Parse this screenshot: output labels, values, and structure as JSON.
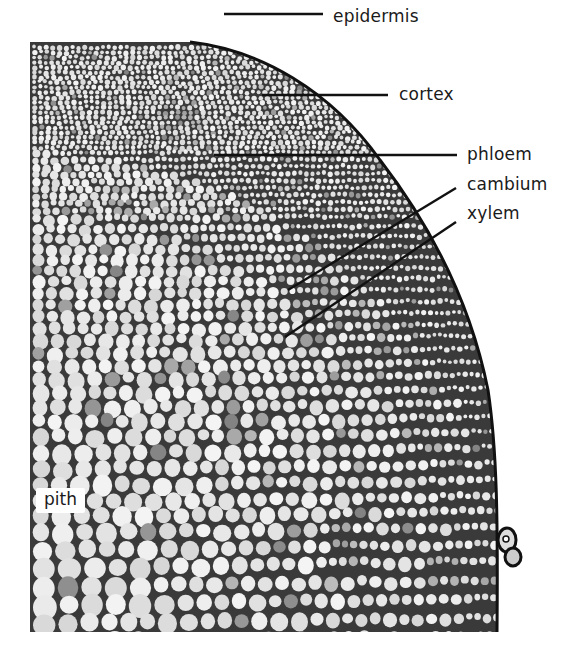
{
  "figure": {
    "labels": [
      {
        "id": "epidermis",
        "text": "epidermis",
        "x": 333,
        "y": 8,
        "line": {
          "x1": 224,
          "y1": 14,
          "x2": 323,
          "y2": 14
        }
      },
      {
        "id": "cortex",
        "text": "cortex",
        "x": 399,
        "y": 86,
        "line": {
          "x1": 262,
          "y1": 95,
          "x2": 388,
          "y2": 95
        }
      },
      {
        "id": "phloem",
        "text": "phloem",
        "x": 467,
        "y": 146,
        "line": {
          "x1": 214,
          "y1": 155,
          "x2": 457,
          "y2": 155
        }
      },
      {
        "id": "cambium",
        "text": "cambium",
        "x": 467,
        "y": 176,
        "line": {
          "x1": 288,
          "y1": 290,
          "x2": 456,
          "y2": 188
        }
      },
      {
        "id": "xylem",
        "text": "xylem",
        "x": 467,
        "y": 205,
        "line": {
          "x1": 285,
          "y1": 337,
          "x2": 456,
          "y2": 222
        }
      }
    ],
    "inset_label": {
      "id": "pith",
      "text": "pith",
      "x": 36,
      "y": 488
    }
  }
}
